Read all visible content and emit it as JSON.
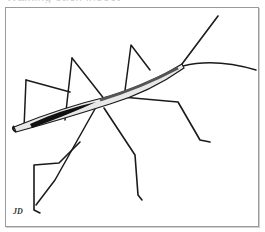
{
  "caption": {
    "text": "Walking stick insect",
    "clipped": true
  },
  "figure": {
    "style": "black and white pen drawing",
    "signature": "JD"
  },
  "colors": {
    "frame_border": "#9a9a9a",
    "background": "#ffffff",
    "ink": "#1a1a1a"
  }
}
